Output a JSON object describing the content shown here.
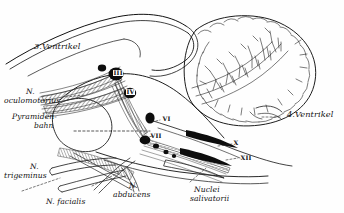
{
  "figure": {
    "domain": "anatomical-line-drawing",
    "title_visible": false,
    "language": "de",
    "width": 344,
    "height": 213,
    "background_color": "#fefefe",
    "ink_color": "#111111"
  },
  "labels": {
    "ventricle3": "3.Ventrikel",
    "ventricle4": "4.Ventrikel",
    "oculomotorius_line1": "N.",
    "oculomotorius_line2": "oculomotorius",
    "pyramidenbahn_line1": "Pyramiden-",
    "pyramidenbahn_line2": "bahn",
    "trigeminus_line1": "N.",
    "trigeminus_line2": "trigeminus",
    "facialis": "N. facialis",
    "abducens_line1": "N.",
    "abducens_line2": "abducens",
    "nuclei_salivatorii_line1": "Nuclei",
    "nuclei_salivatorii_line2": "salivatorii"
  },
  "nuclei": [
    {
      "numeral": "III",
      "name": "nucleus-oculomotorius",
      "x": 113,
      "y": 70
    },
    {
      "numeral": "IV",
      "name": "nucleus-trochlearis",
      "x": 124,
      "y": 88
    },
    {
      "numeral": "VI",
      "name": "nucleus-abducens",
      "x": 160,
      "y": 118
    },
    {
      "numeral": "VII",
      "name": "nucleus-facialis",
      "x": 150,
      "y": 135
    },
    {
      "numeral": "X",
      "name": "nucleus-vagus",
      "x": 228,
      "y": 143
    },
    {
      "numeral": "XII",
      "name": "nucleus-hypoglossus",
      "x": 238,
      "y": 158
    }
  ],
  "structures": [
    {
      "name": "cerebellum",
      "description": "Kleinhirn mit Arbor vitae"
    },
    {
      "name": "brainstem",
      "description": "Hirnstamm"
    },
    {
      "name": "third-ventricle",
      "description": "3. Ventrikel"
    },
    {
      "name": "fourth-ventricle",
      "description": "4. Ventrikel"
    },
    {
      "name": "pyramidal-tract",
      "description": "Pyramidenbahn"
    },
    {
      "name": "cranial-nerve-roots",
      "description": "Hirnnervenwurzeln"
    }
  ]
}
